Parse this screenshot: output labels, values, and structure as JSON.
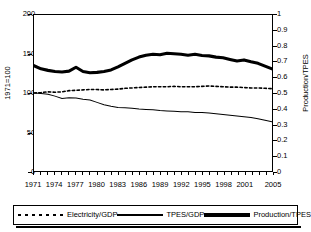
{
  "chart_data": {
    "type": "line",
    "title": "",
    "xlabel": "",
    "ylabel": "1971=100",
    "y2label": "Production/TPES",
    "ylim": [
      0,
      200
    ],
    "y2lim": [
      0,
      1
    ],
    "yticks": [
      "0",
      "50",
      "100",
      "150",
      "200"
    ],
    "y2ticks": [
      "0",
      "0.1",
      "0.2",
      "0.3",
      "0.4",
      "0.5",
      "0.6",
      "0.7",
      "0.8",
      "0.9",
      "1"
    ],
    "grid": false,
    "legend_position": "bottom",
    "x": [
      1971,
      1972,
      1973,
      1974,
      1975,
      1976,
      1977,
      1978,
      1979,
      1980,
      1981,
      1982,
      1983,
      1984,
      1985,
      1986,
      1987,
      1988,
      1989,
      1990,
      1991,
      1992,
      1993,
      1994,
      1995,
      1996,
      1997,
      1998,
      1999,
      2000,
      2001,
      2002,
      2003,
      2004,
      2005
    ],
    "xtick_labels": [
      "1971",
      "1974",
      "1977",
      "1980",
      "1983",
      "1986",
      "1989",
      "1992",
      "1995",
      "1998",
      "2001",
      "2005"
    ],
    "xtick_values": [
      1971,
      1974,
      1977,
      1980,
      1983,
      1986,
      1989,
      1992,
      1995,
      1998,
      2001,
      2005
    ],
    "series": [
      {
        "name": "Electricity/GDP",
        "axis": "left",
        "style": "dotted",
        "values": [
          100.0,
          100.5,
          101.5,
          101.0,
          101.5,
          103.0,
          103.5,
          104.0,
          104.5,
          104.5,
          104.0,
          104.5,
          105.0,
          106.0,
          106.5,
          107.0,
          107.5,
          108.0,
          108.0,
          108.0,
          108.5,
          108.0,
          108.0,
          108.0,
          108.5,
          109.0,
          108.5,
          108.0,
          107.5,
          107.5,
          107.0,
          106.5,
          106.5,
          106.0,
          105.5
        ]
      },
      {
        "name": "TPES/GDP",
        "axis": "left",
        "style": "thin-solid",
        "values": [
          100.0,
          99.5,
          98.5,
          96.0,
          93.0,
          94.0,
          93.5,
          92.0,
          91.0,
          88.0,
          85.0,
          83.0,
          81.5,
          81.0,
          80.5,
          79.5,
          79.0,
          78.5,
          77.5,
          77.0,
          76.5,
          76.0,
          76.0,
          75.0,
          75.0,
          74.5,
          73.5,
          72.5,
          71.5,
          70.5,
          69.5,
          68.5,
          67.0,
          65.0,
          63.0
        ]
      },
      {
        "name": "Production/TPES",
        "axis": "right",
        "style": "thick-solid",
        "values": [
          0.675,
          0.655,
          0.645,
          0.638,
          0.635,
          0.64,
          0.665,
          0.638,
          0.63,
          0.632,
          0.638,
          0.648,
          0.668,
          0.69,
          0.712,
          0.73,
          0.742,
          0.748,
          0.745,
          0.755,
          0.752,
          0.748,
          0.742,
          0.748,
          0.74,
          0.738,
          0.73,
          0.726,
          0.715,
          0.705,
          0.712,
          0.7,
          0.69,
          0.672,
          0.655
        ]
      }
    ]
  },
  "legend": {
    "items": [
      {
        "label": "Electricity/GDP",
        "style": "dotted"
      },
      {
        "label": "TPES/GDP",
        "style": "thin-solid"
      },
      {
        "label": "Production/TPES",
        "style": "thick-solid"
      }
    ]
  }
}
